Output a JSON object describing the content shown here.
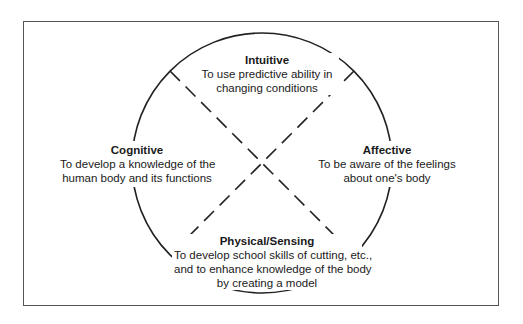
{
  "diagram": {
    "type": "quadrant-circle",
    "colors": {
      "line": "#222222",
      "frame": "#555555",
      "background": "#ffffff"
    },
    "quadrants": [
      {
        "position": "top",
        "title": "Intuitive",
        "lines": [
          "To use predictive ability in",
          "changing conditions"
        ]
      },
      {
        "position": "left",
        "title": "Cognitive",
        "lines": [
          "To develop a knowledge of the",
          "human body and its functions"
        ]
      },
      {
        "position": "right",
        "title": "Affective",
        "lines": [
          "To be aware of the feelings",
          "about one's body"
        ]
      },
      {
        "position": "bottom",
        "title": "Physical/Sensing",
        "lines": [
          "To develop school skills of cutting, etc.,",
          "and to enhance knowledge of the body",
          "by creating a model"
        ]
      }
    ]
  }
}
